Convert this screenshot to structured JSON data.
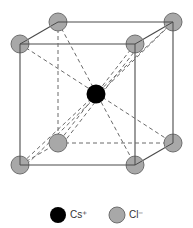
{
  "diagram": {
    "colors": {
      "edge": "#4a4a4a",
      "dashed": "#6a6a6a",
      "cl_fill": "#a8a8a8",
      "cl_stroke": "#6e6e6e",
      "cs_fill": "#000000"
    },
    "atoms": [
      {
        "id": "cl-back-top-left",
        "type": "Cl-",
        "cx": 58,
        "cy": 22
      },
      {
        "id": "cl-back-top-right",
        "type": "Cl-",
        "cx": 173,
        "cy": 22
      },
      {
        "id": "cl-front-top-left",
        "type": "Cl-",
        "cx": 20,
        "cy": 44
      },
      {
        "id": "cl-front-top-right",
        "type": "Cl-",
        "cx": 135,
        "cy": 44
      },
      {
        "id": "cl-back-bottom-left",
        "type": "Cl-",
        "cx": 58,
        "cy": 143
      },
      {
        "id": "cl-back-bottom-right",
        "type": "Cl-",
        "cx": 173,
        "cy": 143
      },
      {
        "id": "cl-front-bottom-left",
        "type": "Cl-",
        "cx": 20,
        "cy": 165
      },
      {
        "id": "cl-front-bottom-right",
        "type": "Cl-",
        "cx": 135,
        "cy": 165
      },
      {
        "id": "cs-center",
        "type": "Cs+",
        "cx": 96,
        "cy": 94
      }
    ]
  },
  "legend": {
    "items": [
      {
        "symbol": "Cs+",
        "label": "Cs⁺",
        "color": "#000000"
      },
      {
        "symbol": "Cl-",
        "label": "Cl⁻",
        "color": "#a8a8a8"
      }
    ]
  }
}
